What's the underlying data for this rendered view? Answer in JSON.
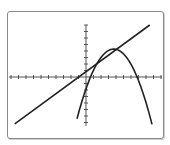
{
  "chart_data": {
    "type": "line",
    "title": "",
    "xlabel": "",
    "ylabel": "",
    "tick_labels": "none shown",
    "scale_note": "No numeric tick labels are visible; the unit scale below is inferred from pixel geometry with ~7.5px per x-tick and ~6.5px per y-tick, origin at pixel (86,77). Treat numeric values as approximate/assumed.",
    "grid": false,
    "legend": "none",
    "axes": {
      "x_ticks_left": 10,
      "x_ticks_right": 10,
      "y_ticks_up": 8,
      "y_ticks_down": 7
    },
    "series": [
      {
        "name": "line",
        "kind": "linear",
        "points": [
          [
            -9.5,
            -7.2
          ],
          [
            8.5,
            8.0
          ]
        ],
        "slope_approx": 0.85,
        "intercept_approx": 0.9
      },
      {
        "name": "parabola",
        "kind": "quadratic-downward",
        "vertex": [
          3.7,
          4.3
        ],
        "roots_approx": [
          -0.5,
          8.0
        ],
        "endpoints": [
          [
            -1.2,
            -7.3
          ],
          [
            8.8,
            -7.3
          ]
        ]
      }
    ],
    "intersections_approx": [
      [
        0.2,
        1.1
      ],
      [
        3.0,
        3.5
      ]
    ]
  },
  "style": {
    "axis_color": "#555555",
    "curve_color": "#222222",
    "frame_color": "#8a8a8a"
  }
}
